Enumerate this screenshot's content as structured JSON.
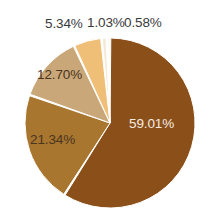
{
  "chart_data": {
    "type": "pie",
    "title": "",
    "subtitle": "",
    "xlabel": "",
    "ylabel": "",
    "grid": false,
    "legend_position": "none",
    "label_format": "percent",
    "start_angle_deg": 0,
    "direction": "clockwise",
    "categories": [
      "59.01%",
      "21.34%",
      "12.70%",
      "5.34%",
      "1.03%",
      "0.58%"
    ],
    "values": [
      59.01,
      21.34,
      12.7,
      5.34,
      1.03,
      0.58
    ],
    "colors": [
      "#8b4f19",
      "#a8762f",
      "#c9a779",
      "#efbe77",
      "#f3ead8",
      "#faf6ee"
    ],
    "slices": [
      {
        "label": "59.01%",
        "value": 59.01,
        "color": "#8b4f19",
        "label_placement": "inside",
        "label_color": "#f4ece2"
      },
      {
        "label": "21.34%",
        "value": 21.34,
        "color": "#a8762f",
        "label_placement": "inside",
        "label_color": "#4a3520"
      },
      {
        "label": "12.70%",
        "value": 12.7,
        "color": "#c9a779",
        "label_placement": "inside",
        "label_color": "#4a3520"
      },
      {
        "label": "5.34%",
        "value": 5.34,
        "color": "#efbe77",
        "label_placement": "outside",
        "label_color": "#3a3a3a"
      },
      {
        "label": "1.03%",
        "value": 1.03,
        "color": "#f3ead8",
        "label_placement": "outside",
        "label_color": "#3a3a3a"
      },
      {
        "label": "0.58%",
        "value": 0.58,
        "color": "#faf6ee",
        "label_placement": "outside",
        "label_color": "#3a3a3a"
      }
    ],
    "total": 100.0,
    "separator_color": "#ffffff",
    "background_color": "#ffffff"
  },
  "labels": {
    "slice_1": "59.01%",
    "slice_2": "21.34%",
    "slice_3": "12.70%",
    "slice_4": "5.34%",
    "slice_5": "1.03%",
    "slice_6": "0.58%"
  }
}
